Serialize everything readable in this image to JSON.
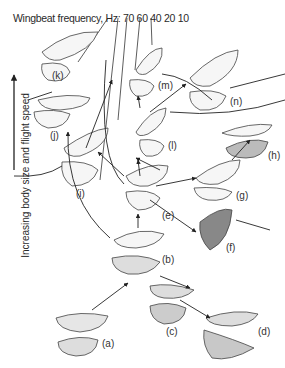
{
  "title": "Wingbeat frequency, Hz: 70 60 40  20 10",
  "axis_label": "Increasing body size and flight speed",
  "frequency_ticks": [
    "70",
    "60",
    "40",
    "20",
    "10"
  ],
  "labels": {
    "a": "(a)",
    "b": "(b)",
    "c": "(c)",
    "d": "(d)",
    "e": "(e)",
    "f": "(f)",
    "g": "(g)",
    "h": "(h)",
    "i": "(i)",
    "j": "(j)",
    "k": "(k)",
    "l": "(l)",
    "m": "(m)",
    "n": "(n)"
  }
}
